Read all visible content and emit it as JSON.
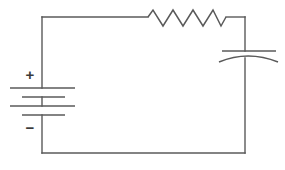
{
  "diagram": {
    "type": "electrical-schematic",
    "background_color": "#ffffff",
    "line_color": "#5a5a5a",
    "canvas": {
      "width": 285,
      "height": 170
    }
  },
  "loop": {
    "name": "circuit-loop",
    "left_x": 42,
    "right_x": 245,
    "top_y": 17,
    "bottom_y": 153
  },
  "battery": {
    "name": "battery",
    "label_plus": "+",
    "label_minus": "−",
    "plus_x": 30,
    "plus_y": 76,
    "minus_x": 30,
    "minus_y": 129,
    "terminal_x": 42,
    "plates": [
      {
        "y": 88,
        "x1": 10,
        "x2": 75,
        "kind": "long"
      },
      {
        "y": 97,
        "x1": 22,
        "x2": 65,
        "kind": "short"
      },
      {
        "y": 106,
        "x1": 10,
        "x2": 75,
        "kind": "long"
      },
      {
        "y": 115,
        "x1": 22,
        "x2": 65,
        "kind": "short"
      }
    ]
  },
  "resistor": {
    "name": "resistor",
    "start_x": 148,
    "end_x": 226,
    "center_y": 17,
    "peak_y": 10,
    "valley_y": 26,
    "segments": 8
  },
  "capacitor": {
    "name": "capacitor",
    "center_x": 245,
    "straight_plate": {
      "y": 51,
      "x1": 222,
      "x2": 276
    },
    "curved_plate": {
      "x1": 219,
      "x2": 278,
      "edge_y": 62,
      "apex_y": 55
    }
  }
}
